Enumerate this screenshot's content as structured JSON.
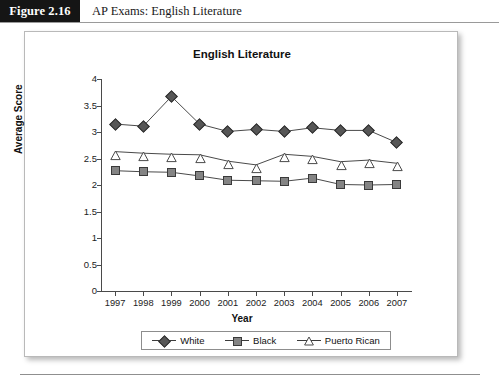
{
  "figure": {
    "tag": "Figure 2.16",
    "caption": "AP Exams: English Literature"
  },
  "chart_data": {
    "type": "line",
    "title": "English Literature",
    "xlabel": "Year",
    "ylabel": "Average Score",
    "categories": [
      "1997",
      "1998",
      "1999",
      "2000",
      "2001",
      "2002",
      "2003",
      "2004",
      "2005",
      "2006",
      "2007"
    ],
    "ylim": [
      0,
      4
    ],
    "yticks": [
      "0",
      "0.5",
      "1",
      "1.5",
      "2",
      "2.5",
      "3",
      "3.5",
      "4"
    ],
    "grid": false,
    "legend_position": "bottom",
    "series": [
      {
        "name": "White",
        "marker": "diamond",
        "color": "#565656",
        "values": [
          3.15,
          3.11,
          3.67,
          3.15,
          3.01,
          3.05,
          3.01,
          3.08,
          3.03,
          3.03,
          2.8
        ]
      },
      {
        "name": "Black",
        "marker": "square",
        "color": "#848484",
        "values": [
          2.27,
          2.25,
          2.24,
          2.17,
          2.09,
          2.08,
          2.07,
          2.13,
          2.01,
          2.0,
          2.01
        ]
      },
      {
        "name": "Puerto Rican",
        "marker": "triangle",
        "color": "#ffffff",
        "values": [
          2.63,
          2.6,
          2.58,
          2.57,
          2.45,
          2.38,
          2.58,
          2.54,
          2.44,
          2.47,
          2.41
        ]
      }
    ]
  }
}
